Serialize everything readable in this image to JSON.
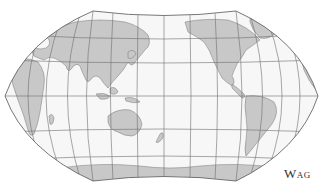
{
  "map": {
    "projection": "Wagner-style pseudocylindrical, Pacific-centered",
    "colors": {
      "ocean": "#f7f7f7",
      "land": "#c8c8c8",
      "graticule": "#6e6e6e",
      "outline": "#555555",
      "background": "#ffffff"
    },
    "graticule": {
      "meridian_spacing_deg": 30,
      "parallel_spacing_deg": 30
    },
    "continents": [
      "Asia",
      "Europe",
      "Africa",
      "Australia",
      "North America",
      "South America",
      "Antarctica"
    ]
  },
  "caption": {
    "text": "Wag"
  }
}
